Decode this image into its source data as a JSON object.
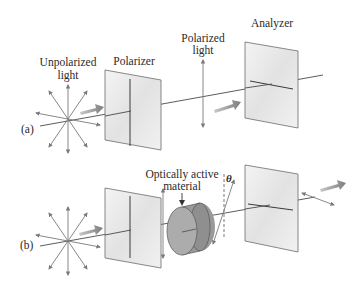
{
  "figure": {
    "panel_a": {
      "tag": "(a)",
      "source_label": [
        "Unpolarized",
        "light"
      ],
      "polarizer_label": "Polarizer",
      "polarized_label": [
        "Polarized",
        "light"
      ],
      "analyzer_label": "Analyzer"
    },
    "panel_b": {
      "tag": "(b)",
      "material_label": [
        "Optically active",
        "material"
      ],
      "angle_symbol": "θ"
    },
    "colors": {
      "line": "#4a4a4a",
      "arrow": "#7a7a7a",
      "flow_arrow": "#8c8c8c",
      "panel_fill": "#ececec",
      "panel_edge": "#6b6b6b",
      "cylinder_fill": "#a9a9a9",
      "cylinder_dark": "#8f8f8f"
    }
  }
}
